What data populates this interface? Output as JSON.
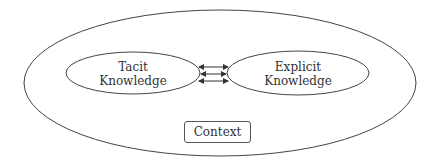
{
  "diagram": {
    "outer_ellipse_label": "",
    "tacit": {
      "line1": "Tacit",
      "line2": "Knowledge"
    },
    "explicit": {
      "line1": "Explicit",
      "line2": "Knowledge"
    },
    "context_label": "Context",
    "connector": {
      "count": 3,
      "direction": "bidirectional"
    }
  }
}
